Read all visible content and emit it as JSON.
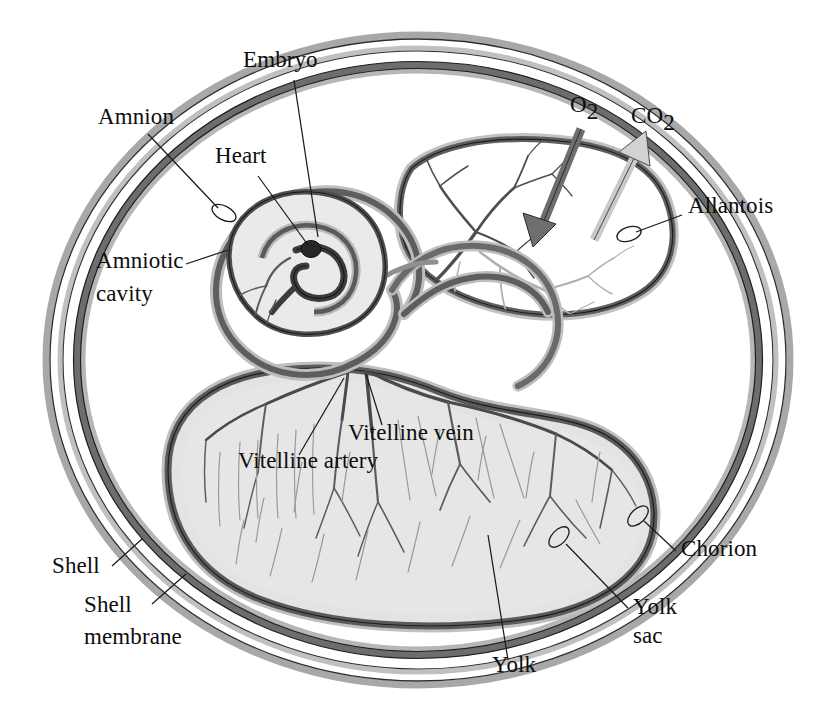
{
  "figure": {
    "background": "#ffffff"
  },
  "colors": {
    "shell": "#a8a8a8",
    "shell_membrane": "#bcbcbc",
    "chorion_dark": "#6d6d6d",
    "membrane_dark": "#5e5e5e",
    "membrane_mid": "#8f8f8f",
    "amniotic_cavity": "#e8e8e8",
    "yolk_fill": "#e3e3e3",
    "allantois_fill": "#ffffff",
    "vessel_dark": "#4a4a4a",
    "vessel_light": "#a5a5a5",
    "heart": "#2a2a2a",
    "label_text": "#0d0d0d",
    "leader_line": "#1a1a1a",
    "o2_arrow": "#707070",
    "co2_arrow": "#c4c4c4"
  },
  "labels": [
    {
      "id": "embryo",
      "text": "Embryo",
      "x": 243,
      "y": 67,
      "anchor": "start"
    },
    {
      "id": "amnion",
      "text": "Amnion",
      "x": 98,
      "y": 124,
      "anchor": "start"
    },
    {
      "id": "heart",
      "text": "Heart",
      "x": 215,
      "y": 163,
      "anchor": "start"
    },
    {
      "id": "amniotic-cavity-line1",
      "text": "Amniotic",
      "x": 96,
      "y": 268,
      "anchor": "start"
    },
    {
      "id": "amniotic-cavity-line2",
      "text": "cavity",
      "x": 96,
      "y": 301,
      "anchor": "start"
    },
    {
      "id": "allantois",
      "text": "Allantois",
      "x": 688,
      "y": 213,
      "anchor": "start"
    },
    {
      "id": "vitelline-vein",
      "text": "Vitelline vein",
      "x": 348,
      "y": 440,
      "anchor": "start"
    },
    {
      "id": "vitelline-artery",
      "text": "Vitelline artery",
      "x": 238,
      "y": 468,
      "anchor": "start"
    },
    {
      "id": "shell",
      "text": "Shell",
      "x": 52,
      "y": 573,
      "anchor": "start"
    },
    {
      "id": "shell-membrane-line1",
      "text": "Shell",
      "x": 84,
      "y": 612,
      "anchor": "start"
    },
    {
      "id": "shell-membrane-line2",
      "text": "membrane",
      "x": 84,
      "y": 644,
      "anchor": "start"
    },
    {
      "id": "chorion",
      "text": "Chorion",
      "x": 681,
      "y": 556,
      "anchor": "start"
    },
    {
      "id": "yolk-sac-line1",
      "text": "Yolk",
      "x": 633,
      "y": 614,
      "anchor": "start"
    },
    {
      "id": "yolk-sac-line2",
      "text": "sac",
      "x": 633,
      "y": 643,
      "anchor": "start"
    },
    {
      "id": "yolk",
      "text": "Yolk",
      "x": 492,
      "y": 672,
      "anchor": "start"
    }
  ],
  "gas_labels": [
    {
      "id": "o2",
      "base": "O",
      "sub": "2",
      "x": 570,
      "y": 112,
      "direction": "inward",
      "meaning": "oxygen diffuses in"
    },
    {
      "id": "co2",
      "base": "CO",
      "sub": "2",
      "x": 631,
      "y": 123,
      "direction": "outward",
      "meaning": "carbon dioxide diffuses out"
    }
  ],
  "structures": [
    {
      "id": "shell",
      "name": "Shell"
    },
    {
      "id": "shell-membrane",
      "name": "Shell membrane"
    },
    {
      "id": "chorion",
      "name": "Chorion"
    },
    {
      "id": "allantois",
      "name": "Allantois"
    },
    {
      "id": "amnion",
      "name": "Amnion"
    },
    {
      "id": "amniotic-cavity",
      "name": "Amniotic cavity"
    },
    {
      "id": "embryo",
      "name": "Embryo"
    },
    {
      "id": "heart",
      "name": "Heart"
    },
    {
      "id": "yolk-sac",
      "name": "Yolk sac"
    },
    {
      "id": "yolk",
      "name": "Yolk"
    },
    {
      "id": "vitelline-artery",
      "name": "Vitelline artery"
    },
    {
      "id": "vitelline-vein",
      "name": "Vitelline vein"
    }
  ]
}
